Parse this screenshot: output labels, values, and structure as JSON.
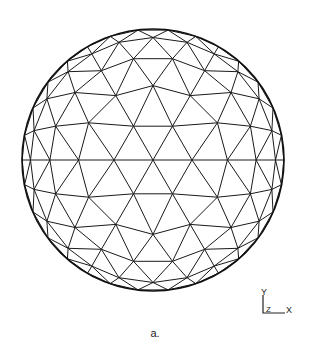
{
  "figure": {
    "caption": "a.",
    "center": [
      153,
      160
    ],
    "radius": 131,
    "frequency": 5,
    "line_color": "#1a1a1a",
    "outline_color": "#111111"
  },
  "axes": {
    "y_label": "Y",
    "z_label": "Z",
    "x_label": "X"
  }
}
